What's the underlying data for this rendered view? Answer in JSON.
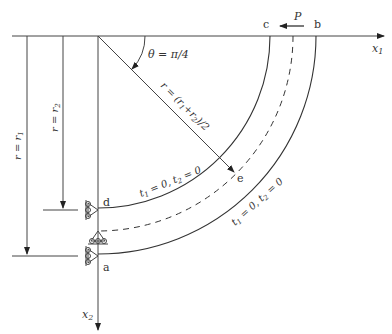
{
  "diagram": {
    "type": "curved beam (quarter annulus) boundary value problem",
    "axes": {
      "x1_label": "x",
      "x1_sub": "1",
      "x2_label": "x",
      "x2_sub": "2"
    },
    "points": {
      "a": "a",
      "b": "b",
      "c": "c",
      "d": "d",
      "e": "e"
    },
    "load": {
      "label": "P"
    },
    "angle": {
      "label": "θ = π/4"
    },
    "dimensions": {
      "outer": "r = r",
      "outer_sub": "1",
      "inner": "r = r",
      "inner_sub": "2",
      "mid": "r = (r",
      "mid_sub1": "1",
      "mid_mid": "+r",
      "mid_sub2": "2",
      "mid_end": ")/2"
    },
    "boundary_conditions": {
      "inner": {
        "t1": "t",
        "t1_sub": "1",
        "eq1": " = 0, ",
        "t2": "t",
        "t2_sub": "2",
        "eq2": " = 0"
      },
      "outer": {
        "t1": "t",
        "t1_sub": "1",
        "eq1": " = 0, ",
        "t2": "t",
        "t2_sub": "2",
        "eq2": " = 0"
      }
    },
    "colors": {
      "line": "#333333",
      "background": "#ffffff"
    }
  }
}
